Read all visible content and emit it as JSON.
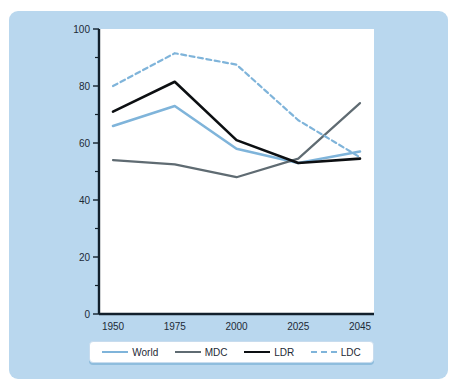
{
  "chart_data": {
    "type": "line",
    "title": "",
    "xlabel": "",
    "ylabel": "",
    "categories": [
      "1950",
      "1975",
      "2000",
      "2025",
      "2045"
    ],
    "x": [
      1950,
      1975,
      2000,
      2025,
      2045
    ],
    "ylim": [
      0,
      100
    ],
    "xlim": [
      1950,
      2045
    ],
    "grid": false,
    "legend_position": "bottom",
    "y_ticks_major": [
      "0",
      "20",
      "40",
      "60",
      "80",
      "100"
    ],
    "y_ticks_major_values": [
      0,
      20,
      40,
      60,
      80,
      100
    ],
    "y_ticks_minor_values": [
      10,
      30,
      50,
      70,
      90
    ],
    "series": [
      {
        "name": "World",
        "color": "#7fb4da",
        "style": "solid",
        "width": 2.6,
        "values": [
          66,
          73,
          58,
          53,
          57
        ]
      },
      {
        "name": "MDC",
        "color": "#5f6b72",
        "style": "solid",
        "width": 2.2,
        "values": [
          54,
          52.5,
          48,
          54.5,
          74
        ]
      },
      {
        "name": "LDR",
        "color": "#0c0f12",
        "style": "solid",
        "width": 2.6,
        "values": [
          71,
          81.5,
          61,
          53,
          54.5
        ]
      },
      {
        "name": "LDC",
        "color": "#7fb4da",
        "style": "dashed",
        "width": 2.2,
        "values": [
          80,
          91.5,
          87.5,
          68,
          55
        ]
      }
    ]
  },
  "colors": {
    "panel_background": "#b9d7ee",
    "plot_background": "#ffffff",
    "axis": "#12202c",
    "tick_label": "#1d2a36",
    "legend_border": "#c8dcee",
    "legend_shadow": "#8fbddd",
    "page_background": "#ffffff"
  },
  "legend": {
    "items": [
      {
        "label": "World",
        "color": "#7fb4da",
        "style": "solid"
      },
      {
        "label": "MDC",
        "color": "#5f6b72",
        "style": "solid"
      },
      {
        "label": "LDR",
        "color": "#0c0f12",
        "style": "solid"
      },
      {
        "label": "LDC",
        "color": "#7fb4da",
        "style": "dashed"
      }
    ]
  }
}
